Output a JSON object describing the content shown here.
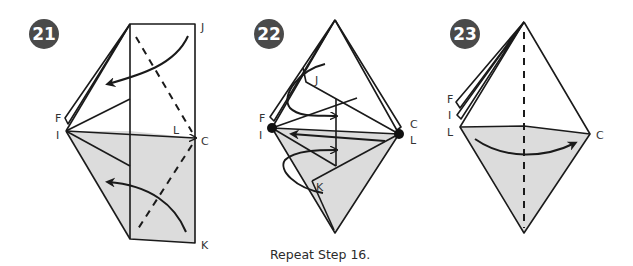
{
  "steps": [
    {
      "number": "21",
      "labels": {
        "F": "F",
        "I": "I",
        "J": "J",
        "L": "L",
        "C": "C",
        "K": "K"
      }
    },
    {
      "number": "22",
      "labels": {
        "F": "F",
        "I": "I",
        "J": "J",
        "C": "C",
        "L": "L",
        "K": "K"
      },
      "caption": "Repeat Step 16."
    },
    {
      "number": "23",
      "labels": {
        "F": "F",
        "I": "I",
        "L": "L",
        "C": "C"
      }
    }
  ],
  "colors": {
    "badge": "#4a4a4a",
    "shade": "#dcdcdc",
    "line": "#1a1a1a"
  }
}
